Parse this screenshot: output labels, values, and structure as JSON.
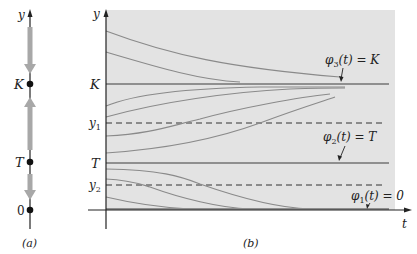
{
  "figure": {
    "panel_a": {
      "caption": "(a)",
      "axis_label": "y",
      "points": [
        {
          "label": "K",
          "y_px": 84
        },
        {
          "label": "T",
          "y_px": 162
        },
        {
          "label": "0",
          "y_px": 210
        }
      ],
      "flow_arrows": [
        {
          "direction": "down",
          "from_px": 28,
          "to_px": 72,
          "meaning": "y > K decreases toward K"
        },
        {
          "direction": "up",
          "from_px": 150,
          "to_px": 98,
          "meaning": "T < y < K increases toward K"
        },
        {
          "direction": "down",
          "from_px": 175,
          "to_px": 199,
          "meaning": "0 < y < T decreases toward 0"
        }
      ]
    },
    "panel_b": {
      "caption": "(b)",
      "x_axis_label": "t",
      "y_axis_label": "y",
      "y_ticks": [
        {
          "label": "K",
          "sub": "",
          "y_px": 84
        },
        {
          "label": "y",
          "sub": "1",
          "y_px": 123
        },
        {
          "label": "T",
          "sub": "",
          "y_px": 163
        },
        {
          "label": "y",
          "sub": "2",
          "y_px": 185
        }
      ],
      "equilibria": [
        {
          "phi": "φ",
          "sub": "3",
          "text": "(t) = K",
          "y_px": 84
        },
        {
          "phi": "φ",
          "sub": "2",
          "text": "(t) = T",
          "y_px": 163
        },
        {
          "phi": "φ",
          "sub": "1",
          "text": "(t) = 0",
          "y_px": 210
        }
      ],
      "dashed_lines": [
        {
          "name": "y1 inflection level",
          "y_px": 123
        },
        {
          "name": "y2 inflection level",
          "y_px": 185
        }
      ],
      "colors": {
        "background": "#e3e3e3",
        "curve": "#8a8a8a",
        "equilibrium": "#8f8f8f",
        "axis": "#222222",
        "dashed": "#333333"
      }
    }
  }
}
